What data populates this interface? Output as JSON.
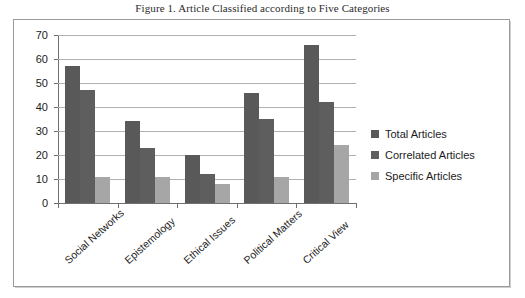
{
  "caption": "Figure 1. Article Classified according to Five Categories",
  "legend": {
    "position": "right",
    "items": [
      {
        "label": "Total Articles",
        "color": "#595959"
      },
      {
        "label": "Correlated Articles",
        "color": "#5e5e5e"
      },
      {
        "label": "Specific Articles",
        "color": "#a6a6a6"
      }
    ]
  },
  "chart_data": {
    "type": "bar",
    "title": "Figure 1. Article Classified according to Five Categories",
    "xlabel": "",
    "ylabel": "",
    "ylim": [
      0,
      70
    ],
    "ytick_step": 10,
    "yticks": [
      "70",
      "60",
      "50",
      "40",
      "30",
      "20",
      "10",
      "0"
    ],
    "grid": true,
    "legend_position": "right",
    "categories": [
      "Social Networks",
      "Epistemology",
      "Ethical Issues",
      "Political Matters",
      "Critical View"
    ],
    "series": [
      {
        "name": "Total Articles",
        "color": "#595959",
        "values": [
          57,
          34,
          20,
          46,
          66
        ]
      },
      {
        "name": "Correlated Articles",
        "color": "#5e5e5e",
        "values": [
          47,
          23,
          12,
          35,
          42
        ]
      },
      {
        "name": "Specific Articles",
        "color": "#a6a6a6",
        "values": [
          11,
          11,
          8,
          11,
          24
        ]
      }
    ]
  }
}
